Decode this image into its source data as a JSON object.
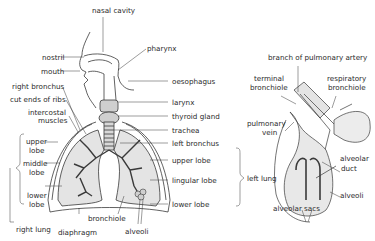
{
  "respiratory_system": {
    "labels": {
      "nasal_cavity": "nasal cavity",
      "pharynx": "pharynx",
      "nostril": "nostril",
      "mouth": "mouth",
      "oesophagus": "oesophagus",
      "right_bronchus": "right bronchus",
      "cut_ends_of_ribs": "cut ends of ribs",
      "intercostal_muscles_1": "intercostal",
      "intercostal_muscles_2": "muscles",
      "larynx": "larynx",
      "thyroid_gland": "thyroid gland",
      "trachea": "trachea",
      "left_bronchus": "left bronchus",
      "upper_lobe_left": "upper lobe",
      "lingular_lobe": "lingular lobe",
      "lower_lobe_left": "lower lobe",
      "left_lung": "left lung",
      "upper_lobe_right_1": "upper",
      "upper_lobe_right_2": "lobe",
      "middle_lobe_1": "middle",
      "middle_lobe_2": "lobe",
      "lower_lobe_right_1": "lower",
      "lower_lobe_right_2": "lobe",
      "right_lung": "right lung",
      "bronchiole": "bronchiole",
      "diaphragm": "diaphragm",
      "alveoli": "alveoli"
    }
  },
  "alveolus_detail": {
    "labels": {
      "branch_of_pulmonary_artery": "branch of pulmonary artery",
      "terminal_bronchiole_1": "terminal",
      "terminal_bronchiole_2": "bronchiole",
      "respiratory_bronchiole_1": "respiratory",
      "respiratory_bronchiole_2": "bronchiole",
      "pulmonary_vein_1": "pulmonary",
      "pulmonary_vein_2": "vein",
      "alveolar_duct_1": "alveolar",
      "alveolar_duct_2": "duct",
      "alveoli": "alveoli",
      "alveolar_sacs": "alveolar sacs"
    }
  },
  "colors": {
    "line": "#3a3a3a",
    "lung_fill": "#e4e4e4",
    "tissue_fill": "#d6d6d6",
    "background": "#ffffff"
  }
}
